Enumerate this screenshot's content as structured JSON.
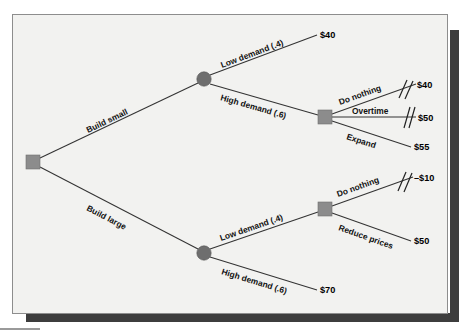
{
  "diagram": {
    "type": "decision-tree",
    "colors": {
      "page_background": "#f2f2f0",
      "frame_border": "#8d8d8d",
      "shadow": "#3d3d3d",
      "decision_node": "#8c8c8c",
      "chance_node": "#6e6e6e",
      "branch_line": "#333333",
      "text": "#111111"
    },
    "nodes": {
      "root": {
        "kind": "decision-square",
        "x": 33,
        "y": 162
      },
      "chance_small": {
        "kind": "chance-circle",
        "x": 204,
        "y": 79
      },
      "chance_large": {
        "kind": "chance-circle",
        "x": 204,
        "y": 253
      },
      "decision_small_high": {
        "kind": "decision-square",
        "x": 325,
        "y": 117
      },
      "decision_large_low": {
        "kind": "decision-square",
        "x": 325,
        "y": 209
      }
    },
    "branches": [
      {
        "id": "build-small",
        "label": "Build small",
        "from": "root",
        "to": "chance_small",
        "rotated": true
      },
      {
        "id": "build-large",
        "label": "Build large",
        "from": "root",
        "to": "chance_large",
        "rotated": true
      },
      {
        "id": "small-low-demand",
        "label": "Low demand (.4)",
        "from": "chance_small",
        "payoff": "$40",
        "probability": 0.4,
        "rotated": true
      },
      {
        "id": "small-high-demand",
        "label": "High demand (.6)",
        "from": "chance_small",
        "to": "decision_small_high",
        "probability": 0.6,
        "rotated": true
      },
      {
        "id": "small-do-nothing",
        "label": "Do nothing",
        "from": "decision_small_high",
        "payoff": "$40",
        "pruned": true,
        "rotated": true
      },
      {
        "id": "small-overtime",
        "label": "Overtime",
        "from": "decision_small_high",
        "payoff": "$50",
        "pruned": true,
        "rotated": false
      },
      {
        "id": "small-expand",
        "label": "Expand",
        "from": "decision_small_high",
        "payoff": "$55",
        "pruned": false,
        "rotated": true
      },
      {
        "id": "large-low-demand",
        "label": "Low demand (.4)",
        "from": "chance_large",
        "to": "decision_large_low",
        "probability": 0.4,
        "rotated": true
      },
      {
        "id": "large-high-demand",
        "label": "High demand (.6)",
        "from": "chance_large",
        "payoff": "$70",
        "probability": 0.6,
        "rotated": true
      },
      {
        "id": "large-do-nothing",
        "label": "Do nothing",
        "from": "decision_large_low",
        "payoff": "–$10",
        "pruned": true,
        "rotated": true
      },
      {
        "id": "large-reduce-prices",
        "label": "Reduce prices",
        "from": "decision_large_low",
        "payoff": "$50",
        "pruned": false,
        "rotated": true
      }
    ],
    "payoffs": {
      "small_low": "$40",
      "small_high_do_nothing": "$40",
      "small_high_overtime": "$50",
      "small_high_expand": "$55",
      "large_low_do_nothing": "–$10",
      "large_low_reduce_prices": "$50",
      "large_high": "$70"
    }
  }
}
